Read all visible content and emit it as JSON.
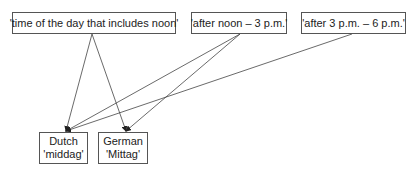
{
  "diagram": {
    "meanings": [
      {
        "id": "m1",
        "label": "'time of the day that includes noon'"
      },
      {
        "id": "m2",
        "label": "'after noon – 3 p.m.'"
      },
      {
        "id": "m3",
        "label": "'after 3 p.m. – 6 p.m.'"
      }
    ],
    "words": [
      {
        "id": "dutch",
        "language": "Dutch",
        "word": "'middag'"
      },
      {
        "id": "german",
        "language": "German",
        "word": "'Mittag'"
      }
    ],
    "edges": [
      {
        "from": "m1",
        "to": "dutch"
      },
      {
        "from": "m1",
        "to": "german"
      },
      {
        "from": "m2",
        "to": "dutch"
      },
      {
        "from": "m2",
        "to": "german"
      },
      {
        "from": "m3",
        "to": "dutch"
      }
    ],
    "colors": {
      "line": "#444444",
      "border": "#555555",
      "text": "#222222"
    }
  }
}
